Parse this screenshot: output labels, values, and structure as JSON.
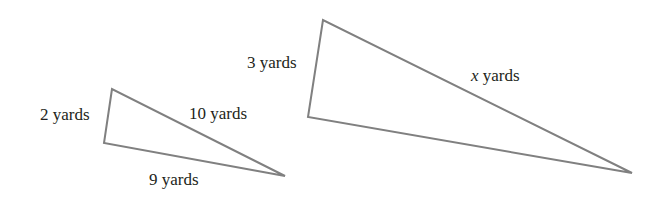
{
  "diagram": {
    "stroke_color": "#808080",
    "text_color": "#231f20",
    "small_triangle": {
      "vertices": [
        [
          112,
          89
        ],
        [
          104,
          143
        ],
        [
          285,
          176
        ]
      ],
      "labels": {
        "left_side": "2 yards",
        "hypotenuse": "10 yards",
        "bottom_side": "9 yards"
      }
    },
    "large_triangle": {
      "vertices": [
        [
          323,
          20
        ],
        [
          308,
          117
        ],
        [
          632,
          173
        ]
      ],
      "labels": {
        "left_side": "3 yards",
        "hypotenuse_var": "x",
        "hypotenuse_unit": " yards"
      }
    }
  }
}
